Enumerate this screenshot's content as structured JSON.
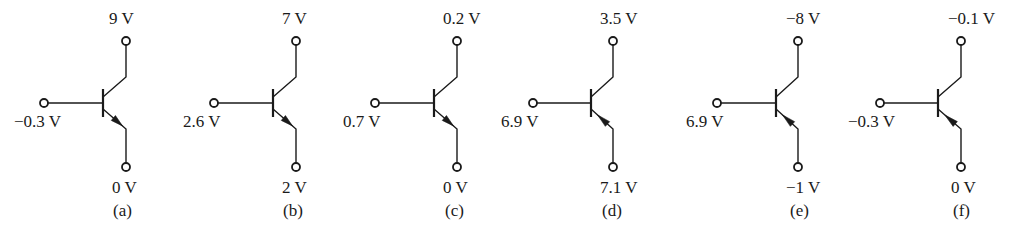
{
  "figure": {
    "circuits": [
      {
        "id": "a",
        "caption": "(a)",
        "type": "NPN",
        "collector": "9 V",
        "base": "−0.3 V",
        "emitter": "0 V"
      },
      {
        "id": "b",
        "caption": "(b)",
        "type": "NPN",
        "collector": "7 V",
        "base": "2.6 V",
        "emitter": "2 V"
      },
      {
        "id": "c",
        "caption": "(c)",
        "type": "NPN",
        "collector": "0.2 V",
        "base": "0.7 V",
        "emitter": "0 V"
      },
      {
        "id": "d",
        "caption": "(d)",
        "type": "PNP",
        "collector": "3.5 V",
        "base": "6.9 V",
        "emitter": "7.1 V"
      },
      {
        "id": "e",
        "caption": "(e)",
        "type": "PNP",
        "collector": "−8 V",
        "base": "6.9 V",
        "emitter": "−1 V"
      },
      {
        "id": "f",
        "caption": "(f)",
        "type": "PNP",
        "collector": "−0.1 V",
        "base": "−0.3 V",
        "emitter": "0 V"
      }
    ]
  },
  "style": {
    "line_color": "#1a1a1a",
    "background": "#ffffff"
  }
}
